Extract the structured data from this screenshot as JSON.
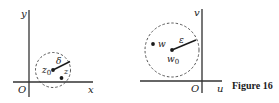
{
  "figure": {
    "caption": "Figure 16",
    "left_panel": {
      "axis_x_label": "x",
      "axis_y_label": "y",
      "origin_label": "O",
      "center_label": "z",
      "center_subscript": "0",
      "point_label": "z",
      "radius_label": "δ"
    },
    "right_panel": {
      "axis_x_label": "u",
      "axis_y_label": "v",
      "origin_label": "O",
      "center_label": "w",
      "center_subscript": "0",
      "point_label": "w",
      "radius_label": "ε"
    }
  },
  "colors": {
    "ink": "#1a1a1a",
    "axis": "#333333",
    "background": "#ffffff"
  }
}
